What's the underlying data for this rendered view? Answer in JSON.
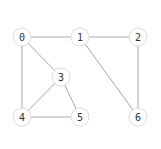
{
  "graph": {
    "nodes": [
      {
        "id": "0",
        "label": "0",
        "x": 22,
        "y": 37
      },
      {
        "id": "1",
        "label": "1",
        "x": 80,
        "y": 37
      },
      {
        "id": "2",
        "label": "2",
        "x": 138,
        "y": 37
      },
      {
        "id": "3",
        "label": "3",
        "x": 61,
        "y": 77
      },
      {
        "id": "4",
        "label": "4",
        "x": 22,
        "y": 117
      },
      {
        "id": "5",
        "label": "5",
        "x": 80,
        "y": 117
      },
      {
        "id": "6",
        "label": "6",
        "x": 138,
        "y": 117
      }
    ],
    "edges": [
      [
        "0",
        "1"
      ],
      [
        "1",
        "2"
      ],
      [
        "0",
        "3"
      ],
      [
        "0",
        "4"
      ],
      [
        "3",
        "4"
      ],
      [
        "3",
        "5"
      ],
      [
        "4",
        "5"
      ],
      [
        "1",
        "6"
      ],
      [
        "2",
        "6"
      ]
    ],
    "node_radius": 9,
    "colors": {
      "edge": "#a6a6a6",
      "node_fill": "#ffffff",
      "node_stroke": "#dcdcdc",
      "label": "#333333"
    }
  }
}
